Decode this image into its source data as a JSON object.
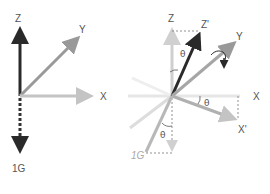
{
  "figure": {
    "colors": {
      "z_axis": "#2a2a2a",
      "y_axis": "#999999",
      "x_axis": "#bdbdbd",
      "gravity": "#333333",
      "faint_axes": "#e2e2e2",
      "guides": "#777777",
      "labels": "#555555"
    }
  },
  "left_diagram": {
    "title": "rest",
    "z_label": "Z",
    "y_label": "Y",
    "x_label": "X",
    "gravity_label": "1G"
  },
  "right_diagram": {
    "title": "tilted",
    "z_label": "Z",
    "z_prime_label": "Z'",
    "y_label": "Y",
    "x_label": "X",
    "x_prime_label": "X'",
    "gravity_label": "1G",
    "angle_symbol": "θ",
    "angle_z": "θ",
    "angle_x": "θ",
    "angle_g": "θ"
  }
}
